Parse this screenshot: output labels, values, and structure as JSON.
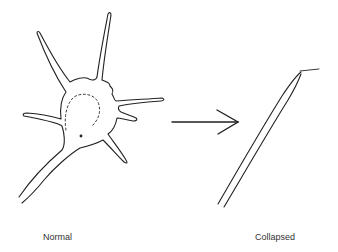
{
  "diagram": {
    "states": [
      {
        "id": "normal",
        "label": "Normal"
      },
      {
        "id": "collapsed",
        "label": "Collapsed"
      }
    ],
    "transition": {
      "from": "normal",
      "to": "collapsed",
      "symbol": "arrow-right"
    },
    "colors": {
      "stroke": "#222222",
      "background": "#ffffff",
      "text": "#333333"
    }
  }
}
